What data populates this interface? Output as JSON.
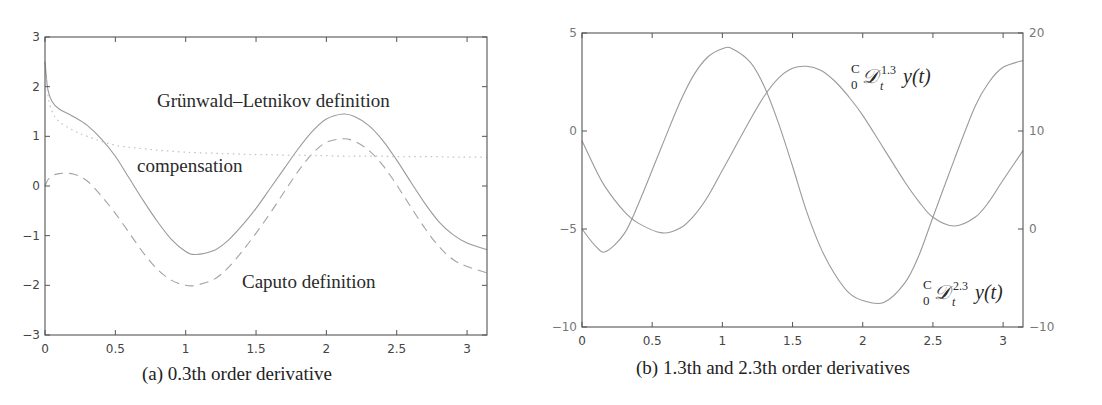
{
  "chart_data": [
    {
      "type": "line",
      "panel": "a",
      "title": "",
      "caption": "(a) 0.3th order derivative",
      "xlabel": "",
      "ylabel": "",
      "xlim": [
        0,
        3.1416
      ],
      "ylim": [
        -3,
        3
      ],
      "xticks": [
        0,
        0.5,
        1,
        1.5,
        2,
        2.5,
        3
      ],
      "xtick_labels": [
        "0",
        "0.5",
        "1",
        "1.5",
        "2",
        "2.5",
        "3"
      ],
      "yticks": [
        -3,
        -2,
        -1,
        0,
        1,
        2,
        3
      ],
      "ytick_labels": [
        "−3",
        "−2",
        "−1",
        "0",
        "1",
        "2",
        "3"
      ],
      "grid": false,
      "legend": "none (inline annotations)",
      "annotations": [
        {
          "text": "Grünwald–Letnikov definition",
          "x": 1.62,
          "y": 1.7
        },
        {
          "text": "compensation",
          "x": 0.65,
          "y": 0.4
        },
        {
          "text": "Caputo definition",
          "x": 1.4,
          "y": -1.95
        }
      ],
      "x": [
        0,
        0.02,
        0.05,
        0.1,
        0.2,
        0.3,
        0.4,
        0.5,
        0.6,
        0.7,
        0.8,
        0.9,
        1.0,
        1.07,
        1.2,
        1.3,
        1.4,
        1.5,
        1.6,
        1.7,
        1.8,
        1.9,
        2.0,
        2.12,
        2.2,
        2.3,
        2.4,
        2.5,
        2.6,
        2.7,
        2.8,
        2.9,
        3.0,
        3.1416
      ],
      "series": [
        {
          "name": "Grünwald–Letnikov definition",
          "style": "solid",
          "color": "#9a9a9a",
          "values": [
            2.5,
            1.95,
            1.7,
            1.55,
            1.4,
            1.22,
            0.95,
            0.6,
            0.15,
            -0.3,
            -0.72,
            -1.08,
            -1.32,
            -1.38,
            -1.3,
            -1.1,
            -0.8,
            -0.45,
            -0.05,
            0.35,
            0.75,
            1.1,
            1.35,
            1.45,
            1.4,
            1.22,
            0.92,
            0.52,
            0.08,
            -0.35,
            -0.72,
            -0.98,
            -1.15,
            -1.28
          ]
        },
        {
          "name": "Caputo definition",
          "style": "dashed",
          "color": "#a8a8a8",
          "values": [
            0.0,
            0.12,
            0.2,
            0.25,
            0.24,
            0.1,
            -0.2,
            -0.55,
            -0.95,
            -1.35,
            -1.68,
            -1.9,
            -2.0,
            -2.0,
            -1.88,
            -1.65,
            -1.32,
            -0.95,
            -0.55,
            -0.12,
            0.3,
            0.65,
            0.88,
            0.95,
            0.9,
            0.72,
            0.42,
            0.02,
            -0.42,
            -0.85,
            -1.22,
            -1.48,
            -1.62,
            -1.75
          ]
        },
        {
          "name": "compensation",
          "style": "dotted",
          "color": "#bdbdbd",
          "values": [
            2.5,
            1.85,
            1.5,
            1.3,
            1.12,
            1.0,
            0.9,
            0.82,
            0.78,
            0.75,
            0.72,
            0.7,
            0.68,
            0.67,
            0.66,
            0.65,
            0.64,
            0.63,
            0.63,
            0.62,
            0.62,
            0.61,
            0.61,
            0.6,
            0.6,
            0.6,
            0.6,
            0.59,
            0.59,
            0.59,
            0.59,
            0.58,
            0.58,
            0.58
          ]
        }
      ]
    },
    {
      "type": "line",
      "panel": "b",
      "title": "",
      "caption": "(b) 1.3th and 2.3th order derivatives",
      "xlabel": "",
      "ylabel": "",
      "xlim": [
        0,
        3.1416
      ],
      "ylim": [
        -10,
        5
      ],
      "ylim_right": [
        -10,
        20
      ],
      "xticks": [
        0,
        0.5,
        1,
        1.5,
        2,
        2.5,
        3
      ],
      "xtick_labels": [
        "0",
        "0.5",
        "1",
        "1.5",
        "2",
        "2.5",
        "3"
      ],
      "yticks": [
        -10,
        -5,
        0,
        5
      ],
      "ytick_labels": [
        "−10",
        "−5",
        "0",
        "5"
      ],
      "yticks_right": [
        -10,
        0,
        10,
        20
      ],
      "ytick_labels_right": [
        "−10",
        "0",
        "10",
        "20"
      ],
      "grid": false,
      "legend": "none (inline annotations)",
      "annotations": [
        {
          "text": "C/0 D_t^{1.3} y(t)",
          "near": "1.3 order curve, upper right"
        },
        {
          "text": "C/0 D_t^{2.3} y(t)",
          "near": "2.3 order curve, lower right"
        }
      ],
      "x": [
        0,
        0.1,
        0.17,
        0.3,
        0.4,
        0.57,
        0.7,
        0.8,
        0.9,
        1.0,
        1.07,
        1.2,
        1.3,
        1.4,
        1.5,
        1.6,
        1.7,
        1.8,
        1.9,
        2.0,
        2.15,
        2.3,
        2.4,
        2.5,
        2.65,
        2.8,
        2.9,
        3.0,
        3.1416
      ],
      "series": [
        {
          "name": "C/0 D_t^{1.3} y(t)",
          "axis": "left",
          "color": "#9a9a9a",
          "values": [
            -0.5,
            -2.0,
            -2.9,
            -4.1,
            -4.7,
            -5.2,
            -4.95,
            -4.3,
            -3.3,
            -2.0,
            -1.1,
            0.6,
            1.8,
            2.7,
            3.2,
            3.3,
            3.1,
            2.55,
            1.75,
            0.8,
            -0.9,
            -2.6,
            -3.6,
            -4.4,
            -4.85,
            -4.4,
            -3.6,
            -2.5,
            -1.0
          ]
        },
        {
          "name": "C/0 D_t^{2.3} y(t)",
          "axis": "right",
          "color": "#9a9a9a",
          "values": [
            0.0,
            -1.8,
            -2.3,
            -0.5,
            2.5,
            8.5,
            13.0,
            15.8,
            17.6,
            18.4,
            18.4,
            17.0,
            14.5,
            10.8,
            6.4,
            1.8,
            -1.9,
            -4.6,
            -6.5,
            -7.3,
            -7.5,
            -5.5,
            -2.7,
            1.2,
            7.0,
            12.5,
            15.0,
            16.5,
            17.2
          ]
        }
      ]
    }
  ],
  "panels": {
    "a": {
      "caption": "(a) 0.3th order derivative",
      "annotation_gl": "Grünwald–Letnikov definition",
      "annotation_comp": "compensation",
      "annotation_caputo": "Caputo definition"
    },
    "b": {
      "caption": "(b) 1.3th and 2.3th order derivatives",
      "label_13_sup": "C",
      "label_13_sub": "0",
      "label_13_op": "𝒟",
      "label_13_order": "1.3",
      "label_13_t": "t",
      "label_13_fn": "y(t)",
      "label_23_sup": "C",
      "label_23_sub": "0",
      "label_23_op": "𝒟",
      "label_23_order": "2.3",
      "label_23_t": "t",
      "label_23_fn": "y(t)"
    }
  },
  "colors": {
    "axis": "#555555",
    "tick_label": "#444444",
    "curve_dark": "#8f8f8f",
    "curve_dashed": "#a3a3a3",
    "curve_dotted": "#c0c0c0",
    "right_axis_label": "#777777"
  }
}
